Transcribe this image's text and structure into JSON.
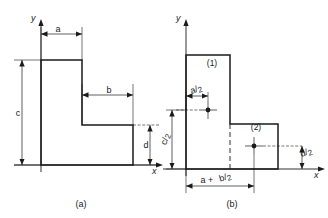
{
  "figure": {
    "stroke_color": "#1a1a1a",
    "background_color": "#ffffff",
    "panels": [
      {
        "id": "a",
        "caption": "(a)",
        "axis_x_label": "x",
        "axis_y_label": "y",
        "dimensions": [
          {
            "name": "a",
            "label": "a",
            "orientation": "horizontal",
            "description": "width of upper vertical leg"
          },
          {
            "name": "b",
            "label": "b",
            "orientation": "horizontal",
            "description": "width of lower horizontal leg beyond the vertical leg"
          },
          {
            "name": "c",
            "label": "c",
            "orientation": "vertical",
            "description": "total height of the section"
          },
          {
            "name": "d",
            "label": "d",
            "orientation": "vertical",
            "description": "height of the lower horizontal leg"
          }
        ]
      },
      {
        "id": "b",
        "caption": "(b)",
        "axis_x_label": "x",
        "axis_y_label": "y",
        "parts": [
          {
            "name": "part-1",
            "label": "(1)",
            "description": "upper vertical rectangle"
          },
          {
            "name": "part-2",
            "label": "(2)",
            "description": "lower right rectangle"
          }
        ],
        "dimensions": [
          {
            "name": "a-over-2",
            "numerator": "a",
            "denominator": "2",
            "label": "a/2",
            "orientation": "horizontal",
            "description": "horizontal centroid distance of part 1"
          },
          {
            "name": "c-over-2",
            "numerator": "c",
            "denominator": "2",
            "label": "c/2",
            "orientation": "vertical",
            "description": "vertical centroid distance of part 1"
          },
          {
            "name": "d-over-2",
            "numerator": "d",
            "denominator": "2",
            "label": "d/2",
            "orientation": "vertical",
            "description": "vertical centroid distance of part 2"
          },
          {
            "name": "a-plus-b-over-2",
            "prefix": "a +",
            "numerator": "b",
            "denominator": "2",
            "label": "a + b/2",
            "orientation": "horizontal",
            "description": "horizontal centroid distance of part 2"
          }
        ]
      }
    ]
  }
}
